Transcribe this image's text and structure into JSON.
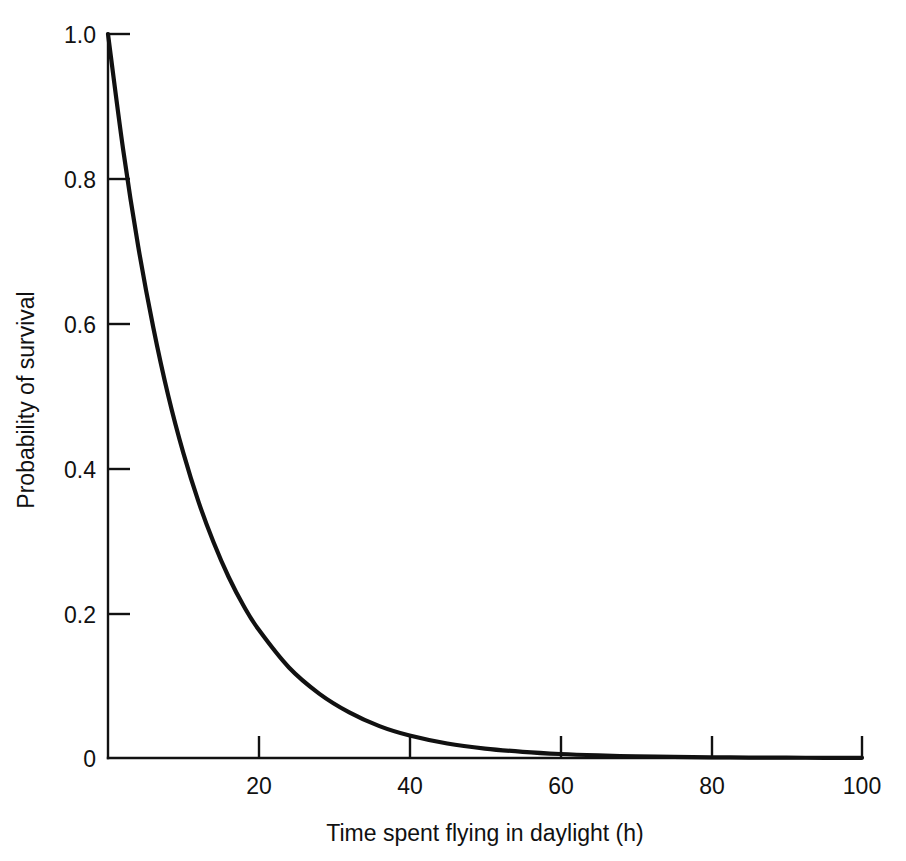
{
  "chart_data": {
    "type": "line",
    "title": "",
    "subtitle": "",
    "xlabel": "Time spent flying in daylight (h)",
    "ylabel": "Probability of survival",
    "xlim": [
      0,
      100
    ],
    "ylim": [
      0,
      1.0
    ],
    "grid": false,
    "legend": null,
    "legend_position": "none",
    "xticks": [
      {
        "value": 0,
        "label": ""
      },
      {
        "value": 20,
        "label": "20"
      },
      {
        "value": 40,
        "label": "40"
      },
      {
        "value": 60,
        "label": "60"
      },
      {
        "value": 80,
        "label": "80"
      },
      {
        "value": 100,
        "label": "100"
      }
    ],
    "yticks": [
      {
        "value": 0,
        "label": "0"
      },
      {
        "value": 0.2,
        "label": "0.2"
      },
      {
        "value": 0.4,
        "label": "0.4"
      },
      {
        "value": 0.6,
        "label": "0.6"
      },
      {
        "value": 0.8,
        "label": "0.8"
      },
      {
        "value": 1.0,
        "label": "1.0"
      }
    ],
    "series": [
      {
        "name": "Probability of survival",
        "color": "#111111",
        "model": "exponential decay",
        "x": [
          0,
          2,
          4,
          6,
          8,
          10,
          12,
          14,
          16,
          18,
          20,
          24,
          28,
          32,
          36,
          40,
          45,
          50,
          55,
          60,
          65,
          70,
          75,
          80,
          85,
          90,
          95,
          100
        ],
        "values": [
          1.0,
          0.841,
          0.707,
          0.595,
          0.5,
          0.421,
          0.354,
          0.298,
          0.25,
          0.21,
          0.177,
          0.125,
          0.089,
          0.063,
          0.044,
          0.031,
          0.02,
          0.013,
          0.0085,
          0.0055,
          0.0036,
          0.0023,
          0.0015,
          0.001,
          0.0006,
          0.0004,
          0.0003,
          0.0002
        ]
      }
    ],
    "annotations": []
  },
  "figure": {
    "background_color": "#ffffff",
    "axis_color": "#111111",
    "curve_color": "#111111"
  }
}
